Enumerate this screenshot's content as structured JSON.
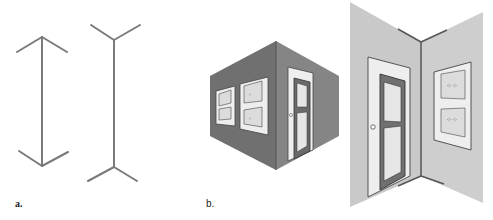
{
  "figure": {
    "panel_a": {
      "label": "a.",
      "description": "Müller-Lyer illusion lines",
      "line_color": "#7a7a7a"
    },
    "panel_b": {
      "label": "b.",
      "description": "Room corners: outside corner (dark walls) and inside corner (light walls)",
      "dark_wall_left": "#6e6e6e",
      "dark_wall_right": "#828282",
      "light_wall": "#c9c9c9",
      "door_frame": "#eeeeee",
      "door_color": "#6a6a6a",
      "panel_color": "#e8e8e8"
    }
  }
}
